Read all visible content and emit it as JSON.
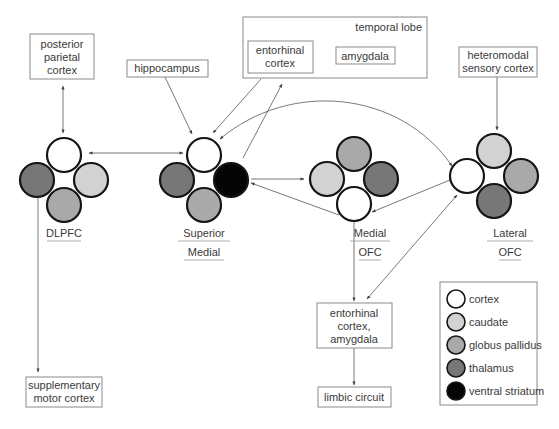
{
  "colors": {
    "cortex": "#ffffff",
    "caudate": "#d2d2d2",
    "globus_pallidus": "#a9a9a9",
    "thalamus": "#777777",
    "ventral_striatum": "#050505",
    "outline": "#151515",
    "box_border": "#8a8a8a",
    "line": "#555555"
  },
  "boxes": {
    "posterior_parietal": [
      "posterior",
      "parietal",
      "cortex"
    ],
    "hippocampus": [
      "hippocampus"
    ],
    "temporal_lobe": {
      "title": "temporal lobe",
      "entorhinal": [
        "entorhinal",
        "cortex"
      ],
      "amygdala": [
        "amygdala"
      ]
    },
    "heteromodal": [
      "heteromodal",
      "sensory cortex"
    ],
    "supplementary_motor": [
      "supplementary",
      "motor cortex"
    ],
    "entorhinal_amygdala": [
      "entorhinal",
      "cortex,",
      "amygdala"
    ],
    "limbic_circuit": [
      "limbic circuit"
    ]
  },
  "clusters": [
    {
      "id": "dlpfc",
      "label": [
        "DLPFC"
      ],
      "cx": 64,
      "cy": 180,
      "top": "cortex",
      "left": "thalamus",
      "right": "caudate",
      "bottom": "globus_pallidus"
    },
    {
      "id": "superior-medial",
      "label": [
        "Superior",
        "Medial"
      ],
      "cx": 204,
      "cy": 180,
      "top": "cortex",
      "left": "thalamus",
      "right": "ventral_striatum",
      "bottom": "globus_pallidus"
    },
    {
      "id": "medial-ofc",
      "label": [
        "Medial",
        "OFC"
      ],
      "cx": 354,
      "cy": 179,
      "top": "globus_pallidus",
      "left": "caudate",
      "right": "thalamus",
      "bottom": "cortex"
    },
    {
      "id": "lateral-ofc",
      "label": [
        "Lateral",
        "OFC"
      ],
      "cx": 494,
      "cy": 176,
      "top": "caudate",
      "left": "cortex",
      "right": "globus_pallidus",
      "bottom": "thalamus"
    }
  ],
  "legend": {
    "items": [
      {
        "key": "cortex",
        "label": "cortex"
      },
      {
        "key": "caudate",
        "label": "caudate"
      },
      {
        "key": "globus_pallidus",
        "label": "globus pallidus"
      },
      {
        "key": "thalamus",
        "label": "thalamus"
      },
      {
        "key": "ventral_striatum",
        "label": "ventral striatum"
      }
    ]
  }
}
